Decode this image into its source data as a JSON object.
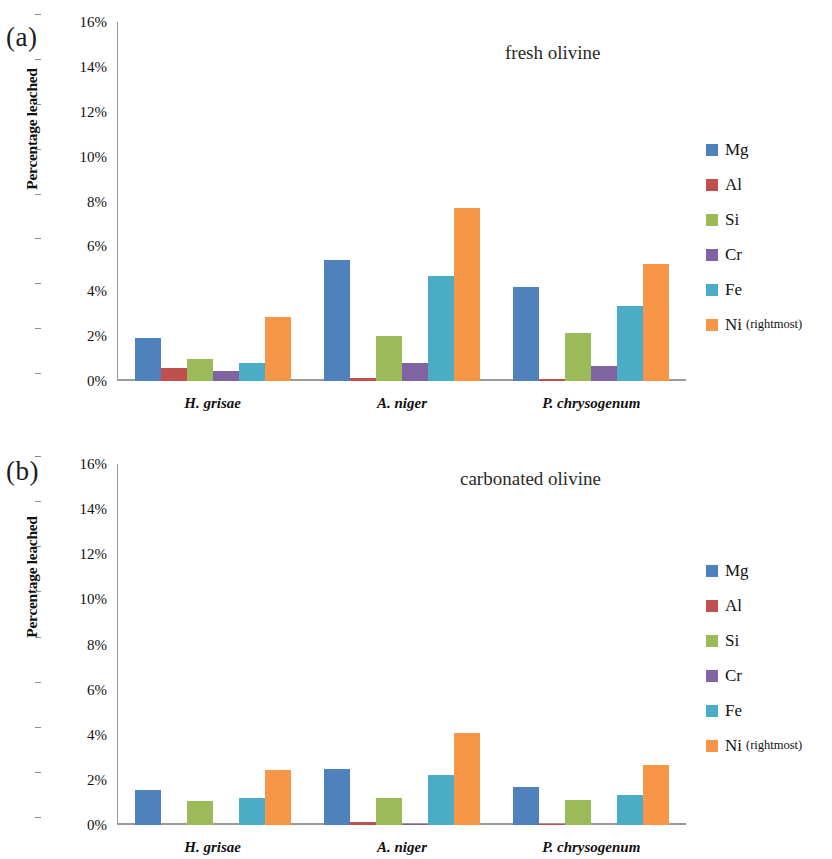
{
  "figure": {
    "panels": [
      {
        "letter": "(a)",
        "title": "fresh olivine",
        "ylabel": "Percentage leached"
      },
      {
        "letter": "(b)",
        "title": "carbonated olivine",
        "ylabel": "Percentage leached"
      }
    ],
    "legend": {
      "items": [
        {
          "label": "Mg",
          "note": "",
          "color": "#4f81bd"
        },
        {
          "label": "Al",
          "note": "",
          "color": "#c0504d"
        },
        {
          "label": "Si",
          "note": "",
          "color": "#9bbb59"
        },
        {
          "label": "Cr",
          "note": "",
          "color": "#8064a2"
        },
        {
          "label": "Fe",
          "note": "",
          "color": "#4bacc6"
        },
        {
          "label": "Ni",
          "note": "(rightmost)",
          "color": "#f79646"
        }
      ]
    },
    "yticks": [
      "0%",
      "2%",
      "4%",
      "6%",
      "8%",
      "10%",
      "12%",
      "14%",
      "16%"
    ]
  },
  "chart_data": [
    {
      "type": "bar",
      "title": "fresh olivine",
      "panel": "(a)",
      "xlabel": "",
      "ylabel": "Percentage leached",
      "ylim": [
        0,
        16
      ],
      "ytick_step": 2,
      "yunit": "%",
      "grid": false,
      "legend_position": "right",
      "categories": [
        "H. grisae",
        "A. niger",
        "P. chrysogenum"
      ],
      "series": [
        {
          "name": "Mg",
          "color": "#4f81bd",
          "values": [
            1.9,
            5.4,
            4.2
          ]
        },
        {
          "name": "Al",
          "color": "#c0504d",
          "values": [
            0.6,
            0.15,
            0.1
          ]
        },
        {
          "name": "Si",
          "color": "#9bbb59",
          "values": [
            1.0,
            2.0,
            2.15
          ]
        },
        {
          "name": "Cr",
          "color": "#8064a2",
          "values": [
            0.45,
            0.8,
            0.65
          ]
        },
        {
          "name": "Fe",
          "color": "#4bacc6",
          "values": [
            0.8,
            4.7,
            3.35
          ]
        },
        {
          "name": "Ni",
          "color": "#f79646",
          "values": [
            2.85,
            7.7,
            5.2
          ]
        }
      ]
    },
    {
      "type": "bar",
      "title": "carbonated olivine",
      "panel": "(b)",
      "xlabel": "",
      "ylabel": "Percentage leached",
      "ylim": [
        0,
        16
      ],
      "ytick_step": 2,
      "yunit": "%",
      "grid": false,
      "legend_position": "right",
      "categories": [
        "H. grisae",
        "A. niger",
        "P. chrysogenum"
      ],
      "series": [
        {
          "name": "Mg",
          "color": "#4f81bd",
          "values": [
            1.55,
            2.5,
            1.7
          ]
        },
        {
          "name": "Al",
          "color": "#c0504d",
          "values": [
            0.0,
            0.12,
            0.05
          ]
        },
        {
          "name": "Si",
          "color": "#9bbb59",
          "values": [
            1.05,
            1.2,
            1.1
          ]
        },
        {
          "name": "Cr",
          "color": "#8064a2",
          "values": [
            0.0,
            0.05,
            0.0
          ]
        },
        {
          "name": "Fe",
          "color": "#4bacc6",
          "values": [
            1.2,
            2.2,
            1.35
          ]
        },
        {
          "name": "Ni",
          "color": "#f79646",
          "values": [
            2.45,
            4.1,
            2.65
          ]
        }
      ]
    }
  ]
}
